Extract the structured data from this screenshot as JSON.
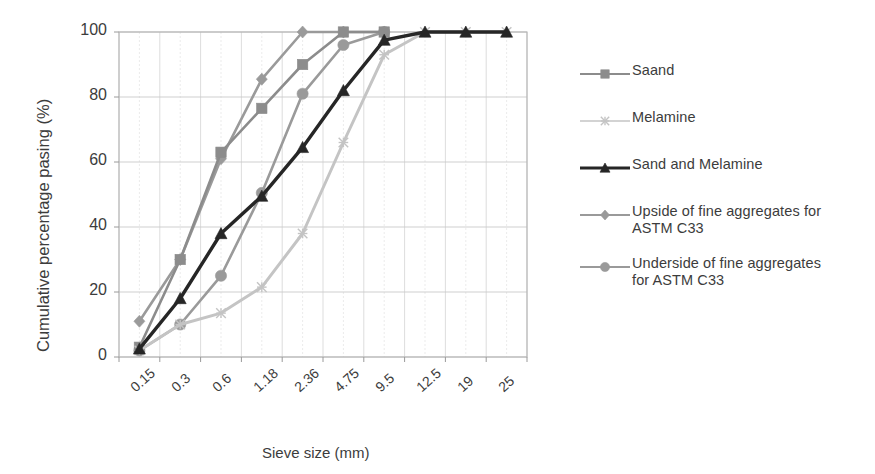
{
  "chart_data": {
    "type": "line",
    "title": "",
    "xlabel": "Sieve size (mm)",
    "ylabel": "Cumulative percentage pasing (%)",
    "categories": [
      "0.15",
      "0.3",
      "0.6",
      "1.18",
      "2.36",
      "4.75",
      "9.5",
      "12.5",
      "19",
      "25"
    ],
    "ylim": [
      0,
      100
    ],
    "yticks": [
      "0",
      "20",
      "40",
      "60",
      "80",
      "100"
    ],
    "grid": true,
    "legend_position": "right",
    "series": [
      {
        "name": "Saand",
        "marker": "square",
        "color": "#8c8c8c",
        "values": [
          3,
          30,
          63,
          76.5,
          90,
          100,
          100,
          null,
          null,
          null
        ]
      },
      {
        "name": "Melamine",
        "marker": "cross",
        "color": "#c4c4c4",
        "values": [
          2,
          10,
          13.5,
          21.5,
          38,
          66,
          93,
          100,
          100,
          100
        ]
      },
      {
        "name": "Sand and Melamine",
        "marker": "triangle",
        "color": "#262626",
        "values": [
          2.5,
          18,
          38,
          49.5,
          64.5,
          82,
          97.5,
          100,
          100,
          100
        ]
      },
      {
        "name": "Upside of fine aggregates for\nASTM C33",
        "marker": "diamond",
        "color": "#9a9a9a",
        "values": [
          11,
          30,
          61,
          85.5,
          100,
          100,
          100,
          null,
          null,
          null
        ]
      },
      {
        "name": "Underside of fine aggregates\nfor ASTM C33",
        "marker": "circle",
        "color": "#9a9a9a",
        "values": [
          2,
          10,
          25,
          50.5,
          81,
          96,
          100,
          null,
          null,
          null
        ]
      }
    ]
  }
}
